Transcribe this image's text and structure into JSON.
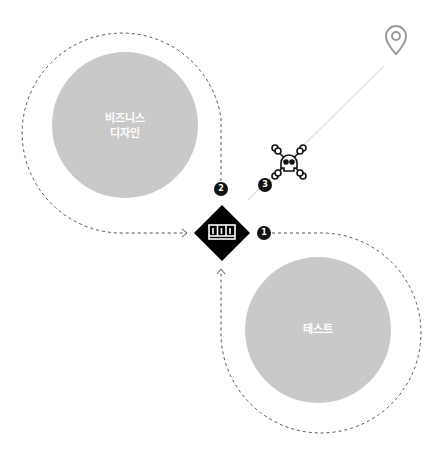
{
  "diagram": {
    "colors": {
      "circle_fill": "#c9c9c9",
      "dashed_path": "#555555",
      "badge": "#111111",
      "diamond": "#000000",
      "line": "#dddddd",
      "pin": "#9a9a9a"
    },
    "nodes": {
      "business_design": {
        "line1": "비즈니스",
        "line2": "디자인"
      },
      "test": {
        "label": "테스트"
      }
    },
    "badges": [
      {
        "number": "1"
      },
      {
        "number": "2"
      },
      {
        "number": "3"
      }
    ],
    "icons": {
      "center": "kanban-board-icon",
      "danger": "skull-crossbones-icon",
      "destination": "map-pin-icon"
    }
  }
}
